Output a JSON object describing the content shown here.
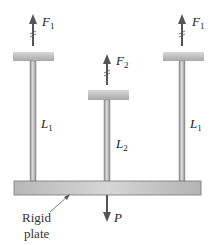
{
  "diagram": {
    "forces": {
      "left_top": {
        "symbol": "F",
        "subscript": "1"
      },
      "center_top": {
        "symbol": "F",
        "subscript": "2"
      },
      "right_top": {
        "symbol": "F",
        "subscript": "1"
      },
      "load": {
        "symbol": "P"
      }
    },
    "lengths": {
      "left_bar": {
        "symbol": "L",
        "subscript": "1"
      },
      "center_bar": {
        "symbol": "L",
        "subscript": "2"
      },
      "right_bar": {
        "symbol": "L",
        "subscript": "1"
      }
    },
    "plate_label": {
      "line1": "Rigid",
      "line2": "plate"
    },
    "colors": {
      "bar": "#9a9a9a",
      "cap": "#bdbdbd",
      "plate": "#c4c4c4",
      "arrow": "#555555"
    }
  }
}
